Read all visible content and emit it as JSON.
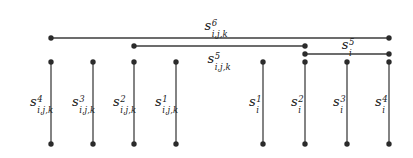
{
  "figure": {
    "background_color": "#ffffff",
    "line_color": "#3c3c3c",
    "dot_color": "#2b2b2b",
    "width": 413,
    "height": 158
  },
  "horizontal_intervals": [
    {
      "id": "interval-s6-ijk",
      "label": {
        "base": "s",
        "sup": "6",
        "sub": "i,j,k"
      },
      "x_start": 51,
      "x_end": 389,
      "y": 38,
      "label_x": 216,
      "label_y": 17,
      "label_position": "above"
    },
    {
      "id": "interval-s5-ijk",
      "label": {
        "base": "s",
        "sup": "5",
        "sub": "i,j,k"
      },
      "x_start": 134,
      "x_end": 305,
      "y": 46,
      "label_x": 219,
      "label_y": 50,
      "label_position": "below"
    },
    {
      "id": "interval-s5-i",
      "label": {
        "base": "s",
        "sup": "5",
        "sub": "i"
      },
      "x_start": 305,
      "x_end": 389,
      "y": 54,
      "label_x": 348,
      "label_y": 36,
      "label_position": "above"
    }
  ],
  "vertical_stems": [
    {
      "id": "stem-s4-ijk",
      "label": {
        "base": "s",
        "sup": "4",
        "sub": "i,j,k"
      },
      "x": 51,
      "y_top": 62,
      "y_bottom": 144,
      "label_x": 30,
      "label_y": 93
    },
    {
      "id": "stem-s3-ijk",
      "label": {
        "base": "s",
        "sup": "3",
        "sub": "i,j,k"
      },
      "x": 93,
      "y_top": 62,
      "y_bottom": 144,
      "label_x": 72,
      "label_y": 93
    },
    {
      "id": "stem-s2-ijk",
      "label": {
        "base": "s",
        "sup": "2",
        "sub": "i,j,k"
      },
      "x": 134,
      "y_top": 62,
      "y_bottom": 144,
      "label_x": 113,
      "label_y": 93
    },
    {
      "id": "stem-s1-ijk",
      "label": {
        "base": "s",
        "sup": "1",
        "sub": "i,j,k"
      },
      "x": 176,
      "y_top": 62,
      "y_bottom": 144,
      "label_x": 155,
      "label_y": 93
    },
    {
      "id": "stem-s1-i",
      "label": {
        "base": "s",
        "sup": "1",
        "sub": "i"
      },
      "x": 263,
      "y_top": 62,
      "y_bottom": 144,
      "label_x": 249,
      "label_y": 93
    },
    {
      "id": "stem-s2-i",
      "label": {
        "base": "s",
        "sup": "2",
        "sub": "i"
      },
      "x": 305,
      "y_top": 62,
      "y_bottom": 144,
      "label_x": 291,
      "label_y": 93
    },
    {
      "id": "stem-s3-i",
      "label": {
        "base": "s",
        "sup": "3",
        "sub": "i"
      },
      "x": 347,
      "y_top": 62,
      "y_bottom": 144,
      "label_x": 333,
      "label_y": 93
    },
    {
      "id": "stem-s4-i",
      "label": {
        "base": "s",
        "sup": "4",
        "sub": "i"
      },
      "x": 389,
      "y_top": 62,
      "y_bottom": 144,
      "label_x": 375,
      "label_y": 93
    }
  ]
}
